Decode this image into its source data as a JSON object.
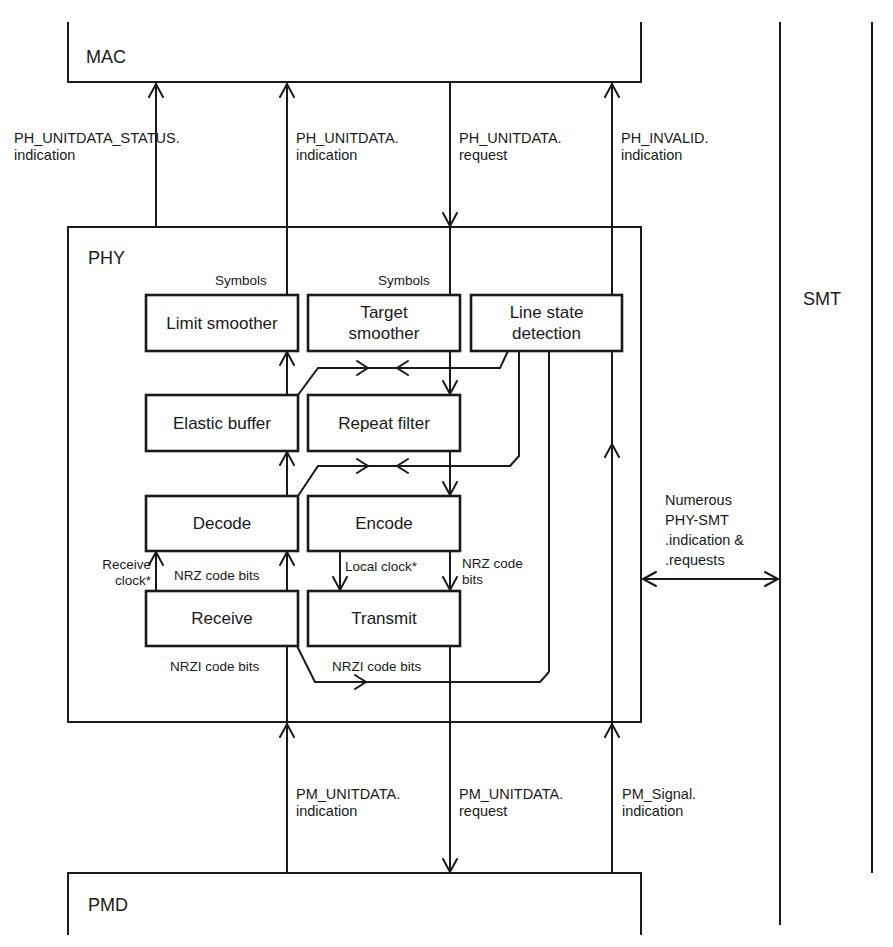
{
  "layers": {
    "mac": "MAC",
    "phy": "PHY",
    "pmd": "PMD",
    "smt": "SMT"
  },
  "mac_phy_signals": [
    {
      "line1": "PH_UNITDATA_STATUS.",
      "line2": "indication",
      "direction": "up"
    },
    {
      "line1": "PH_UNITDATA.",
      "line2": "indication",
      "direction": "up"
    },
    {
      "line1": "PH_UNITDATA.",
      "line2": "request",
      "direction": "down"
    },
    {
      "line1": "PH_INVALID.",
      "line2": "indication",
      "direction": "up"
    }
  ],
  "phy_pmd_signals": [
    {
      "line1": "PM_UNITDATA.",
      "line2": "indication",
      "direction": "up"
    },
    {
      "line1": "PM_UNITDATA.",
      "line2": "request",
      "direction": "down"
    },
    {
      "line1": "PM_Signal.",
      "line2": "indication",
      "direction": "up"
    }
  ],
  "phy_smt_signal": {
    "lines": [
      "Numerous",
      "PHY-SMT",
      ".indication &",
      ".requests"
    ],
    "direction": "bidirectional"
  },
  "blocks": {
    "limit_smoother": "Limit smoother",
    "target_smoother_1": "Target",
    "target_smoother_2": "smoother",
    "line_state_1": "Line state",
    "line_state_2": "detection",
    "elastic_buffer": "Elastic buffer",
    "repeat_filter": "Repeat filter",
    "decode": "Decode",
    "encode": "Encode",
    "receive": "Receive",
    "transmit": "Transmit"
  },
  "internal_labels": {
    "symbols_left": "Symbols",
    "symbols_right": "Symbols",
    "receive_clock_1": "Receive",
    "receive_clock_2": "clock*",
    "nrz_code_bits_rx": "NRZ code bits",
    "local_clock": "Local clock*",
    "nrz_code_bits_tx_1": "NRZ code",
    "nrz_code_bits_tx_2": "bits",
    "nrzi_code_bits_rx": "NRZI code bits",
    "nrzi_code_bits_tx": "NRZI code bits"
  }
}
